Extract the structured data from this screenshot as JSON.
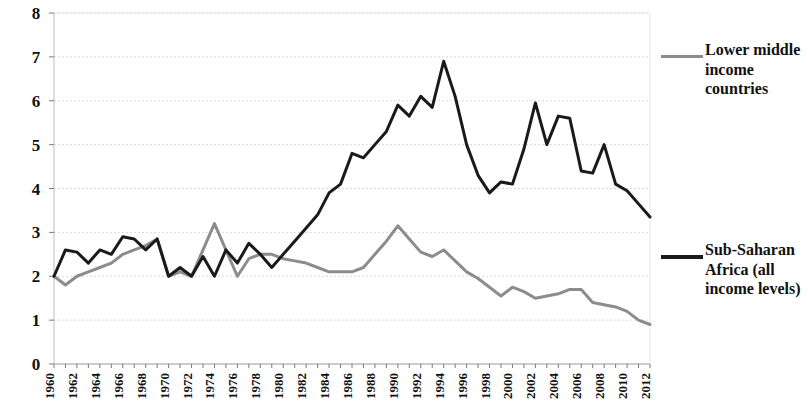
{
  "chart_data": {
    "type": "line",
    "title": "",
    "xlabel": "",
    "ylabel": "",
    "xlim": [
      1960,
      2012
    ],
    "ylim": [
      0,
      8
    ],
    "grid": true,
    "legend_position": "right",
    "y_ticks": [
      "0",
      "1",
      "2",
      "3",
      "4",
      "5",
      "6",
      "7",
      "8"
    ],
    "x_ticks": [
      "1960",
      "1962",
      "1964",
      "1966",
      "1968",
      "1970",
      "1972",
      "1974",
      "1976",
      "1978",
      "1980",
      "1982",
      "1984",
      "1986",
      "1988",
      "1990",
      "1992",
      "1994",
      "1996",
      "1998",
      "2000",
      "2002",
      "2004",
      "2006",
      "2008",
      "2010",
      "2012"
    ],
    "x": [
      1960,
      1961,
      1962,
      1963,
      1964,
      1965,
      1966,
      1967,
      1968,
      1969,
      1970,
      1971,
      1972,
      1973,
      1974,
      1975,
      1976,
      1977,
      1978,
      1979,
      1980,
      1981,
      1982,
      1983,
      1984,
      1985,
      1986,
      1987,
      1988,
      1989,
      1990,
      1991,
      1992,
      1993,
      1994,
      1995,
      1996,
      1997,
      1998,
      1999,
      2000,
      2001,
      2002,
      2003,
      2004,
      2005,
      2006,
      2007,
      2008,
      2009,
      2010,
      2011,
      2012
    ],
    "series": [
      {
        "name": "Lower middle income countries",
        "color": "#8c8c8c",
        "width": 3,
        "values": [
          2.0,
          1.8,
          2.0,
          2.1,
          2.2,
          2.3,
          2.5,
          2.6,
          2.7,
          2.85,
          2.0,
          2.1,
          2.0,
          2.6,
          3.2,
          2.6,
          2.0,
          2.4,
          2.5,
          2.5,
          2.4,
          2.35,
          2.3,
          2.2,
          2.1,
          2.1,
          2.1,
          2.2,
          2.5,
          2.8,
          3.15,
          2.85,
          2.55,
          2.45,
          2.6,
          2.35,
          2.1,
          1.95,
          1.75,
          1.55,
          1.75,
          1.65,
          1.5,
          1.55,
          1.6,
          1.7,
          1.7,
          1.4,
          1.35,
          1.3,
          1.2,
          1.0,
          0.9
        ]
      },
      {
        "name": "Sub-Saharan Africa (all income levels)",
        "color": "#1a1a1a",
        "width": 3,
        "values": [
          2.0,
          2.6,
          2.55,
          2.3,
          2.6,
          2.5,
          2.9,
          2.85,
          2.6,
          2.85,
          2.0,
          2.2,
          2.0,
          2.45,
          2.0,
          2.6,
          2.3,
          2.75,
          2.5,
          2.2,
          2.5,
          2.8,
          3.1,
          3.4,
          3.9,
          4.1,
          4.8,
          4.7,
          5.0,
          5.3,
          5.9,
          5.65,
          6.1,
          5.85,
          6.9,
          6.1,
          5.0,
          4.3,
          3.9,
          4.15,
          4.1,
          4.9,
          5.95,
          5.0,
          5.65,
          5.6,
          4.4,
          4.35,
          5.0,
          4.1,
          3.95,
          3.65,
          3.35
        ]
      }
    ],
    "plot_box": {
      "left": 54,
      "right": 650,
      "top": 13,
      "bottom": 364
    }
  },
  "legend": {
    "entries": [
      {
        "label": "Lower middle income countries",
        "color": "#8c8c8c"
      },
      {
        "label": "Sub-Saharan Africa (all income levels)",
        "color": "#1a1a1a"
      }
    ]
  }
}
